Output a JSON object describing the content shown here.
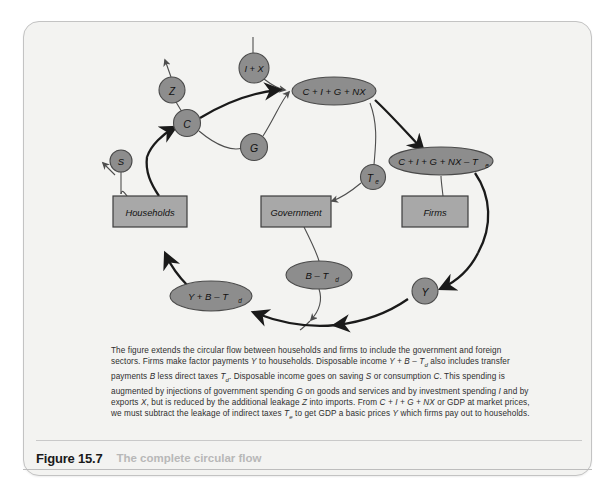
{
  "figure": {
    "number": "Figure 15.7",
    "title": "The complete circular flow"
  },
  "caption": {
    "line1_a": "The figure extends the circular flow between households and firms to include the government and",
    "line2_a": "foreign sectors. Firms make factor payments ",
    "line2_y": "Y",
    "line2_b": " to households. Disposable income ",
    "line2_expr": "Y + B – T",
    "line2_sub": "d",
    "line2_c": " also",
    "line3_a": "includes transfer payments ",
    "line3_b1": "B",
    "line3_b": " less direct taxes ",
    "line3_t": "T",
    "line3_tsub": "d",
    "line3_c": ". Disposable income goes on saving ",
    "line3_s": "S",
    "line3_d": " or consumption",
    "line4_a": "C",
    "line4_b": ". This spending is augmented by injections of government spending ",
    "line4_g": "G",
    "line4_c": " on goods and services and by",
    "line5_a": "investment spending ",
    "line5_i": "I",
    "line5_b": " and by exports ",
    "line5_x": "X",
    "line5_c": ", but is reduced by the additional leakage ",
    "line5_z": "Z",
    "line5_d": " into imports. From",
    "line6_a": "C + I + G + NX",
    "line6_b": " or GDP at market prices, we must subtract the leakage of indirect taxes ",
    "line6_t": "T",
    "line6_tsub": "e",
    "line6_c": " to get GDP",
    "line7_a": "a basic prices ",
    "line7_y": "Y",
    "line7_b": " which firms pay out to households."
  },
  "diagram": {
    "colors": {
      "node_fill": "#8d8d8d",
      "node_stroke": "#4a4a4a",
      "box_fill": "#a8a8a8",
      "box_stroke": "#3d3d3d",
      "thick_flow": "#1a1a1a",
      "thin_flow": "#4d4d4d",
      "canvas": "#f3f3f1"
    },
    "boxes": [
      {
        "id": "households",
        "label": "Households",
        "cx": 127,
        "cy": 190,
        "w": 74,
        "h": 31
      },
      {
        "id": "government",
        "label": "Government",
        "cx": 273,
        "cy": 190,
        "w": 70,
        "h": 31
      },
      {
        "id": "firms",
        "label": "Firms",
        "cx": 412,
        "cy": 190,
        "w": 66,
        "h": 31
      }
    ],
    "nodes": [
      {
        "id": "node-s",
        "label": "S",
        "cx": 98,
        "cy": 162,
        "rx": 11,
        "ry": 11,
        "shape": "circle"
      },
      {
        "id": "node-z",
        "label": "Z",
        "cx": 149,
        "cy": 69,
        "rx": 13,
        "ry": 13,
        "shape": "circle"
      },
      {
        "id": "node-c",
        "label": "C",
        "cx": 164,
        "cy": 102,
        "rx": 13.5,
        "ry": 13.5,
        "shape": "circle"
      },
      {
        "id": "node-ix",
        "label": "I + X",
        "cx": 232,
        "cy": 47,
        "rx": 15,
        "ry": 15,
        "shape": "circle"
      },
      {
        "id": "node-g",
        "label": "G",
        "cx": 232,
        "cy": 125,
        "rx": 13.5,
        "ry": 13.5,
        "shape": "circle"
      },
      {
        "id": "node-cignx",
        "label": "C + I + G + NX",
        "cx": 311,
        "cy": 70,
        "rx": 42,
        "ry": 14,
        "shape": "ellipse"
      },
      {
        "id": "node-te",
        "label": "T",
        "sub": "e",
        "cx": 349,
        "cy": 156,
        "rx": 12.5,
        "ry": 12.5,
        "shape": "circle"
      },
      {
        "id": "node-cignx-te",
        "label": "C + I + G + NX – T",
        "sub": "e",
        "cx": 418,
        "cy": 140,
        "rx": 52,
        "ry": 14,
        "shape": "ellipse"
      },
      {
        "id": "node-y",
        "label": "Y",
        "cx": 394,
        "cy": 270,
        "rx": 13,
        "ry": 13,
        "shape": "circle"
      },
      {
        "id": "node-btd",
        "label": "B – T",
        "sub": "d",
        "cx": 297,
        "cy": 254,
        "rx": 33,
        "ry": 14,
        "shape": "ellipse"
      },
      {
        "id": "node-ybtd",
        "label": "Y + B – T",
        "sub": "d",
        "cx": 188,
        "cy": 275,
        "rx": 41,
        "ry": 15,
        "shape": "ellipse"
      }
    ]
  }
}
